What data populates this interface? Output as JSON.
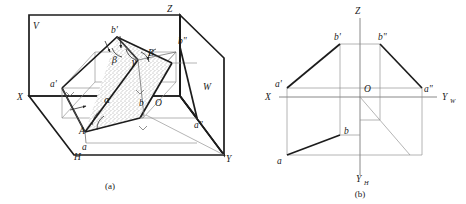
{
  "figure": {
    "type": "engineering-projection-drawing",
    "captions": {
      "left": "(a)",
      "right": "(b)"
    }
  },
  "panel_a": {
    "name": "pictorial-octant-view",
    "plane_labels": {
      "v_plane": "V",
      "h_plane": "H",
      "w_plane": "W"
    },
    "axis_labels": {
      "x": "X",
      "y": "Y",
      "z": "Z"
    },
    "origin_label": "O",
    "space_points": {
      "A": "A",
      "B": "B"
    },
    "projection_points": {
      "a_front": "a'",
      "b_front": "b'",
      "a_top": "a",
      "b_top": "b",
      "a_side": "a\"",
      "b_side": "b\""
    },
    "angles": {
      "alpha": "α",
      "beta": "β",
      "gamma": "γ"
    }
  },
  "panel_b": {
    "name": "three-view-projection",
    "axis_labels": {
      "x": "X",
      "z": "Z",
      "y_w": "Y",
      "y_w_sub": "W",
      "y_h": "Y",
      "y_h_sub": "H"
    },
    "origin_label": "O",
    "projection_points": {
      "a_front": "a'",
      "b_front": "b'",
      "a_top": "a",
      "b_top": "b",
      "a_side": "a\"",
      "b_side": "b\""
    }
  },
  "colors": {
    "ink_heavy": "#1c1c1c",
    "ink_light": "#8d8d8d",
    "axis": "#6b6b6b",
    "background": "#ffffff",
    "stipple": "#555555"
  }
}
